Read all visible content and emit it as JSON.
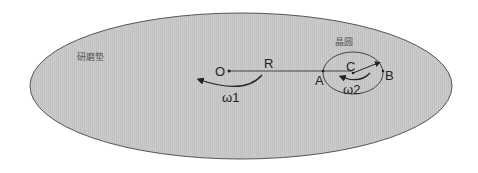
{
  "labels": {
    "pad": "研磨垫",
    "wafer": "晶圆",
    "center_o": "O",
    "radius_r": "R",
    "point_a": "A",
    "point_b": "B",
    "center_c": "C",
    "omega1": "ω1",
    "omega2": "ω2"
  },
  "colors": {
    "pad_fill": "#c8c8c8",
    "stroke": "#444444"
  }
}
